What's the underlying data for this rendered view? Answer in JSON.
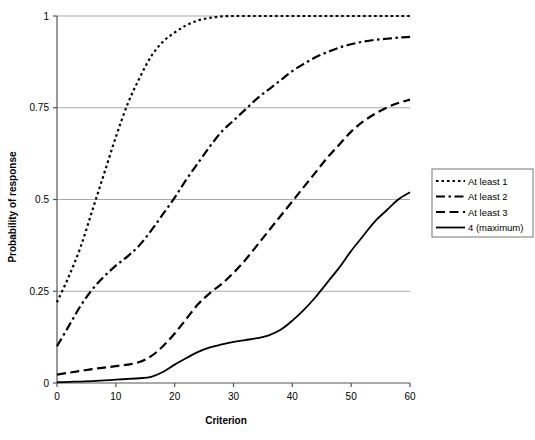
{
  "chart_data": {
    "type": "line",
    "title": "",
    "xlabel": "Criterion",
    "ylabel": "Probability of response",
    "xlim": [
      0,
      60
    ],
    "ylim": [
      0,
      1
    ],
    "xticks": [
      0,
      10,
      20,
      30,
      40,
      50,
      60
    ],
    "yticks": [
      0,
      0.25,
      0.5,
      0.75,
      1
    ],
    "xtick_labels": [
      "0",
      "10",
      "20",
      "30",
      "40",
      "50",
      "60"
    ],
    "ytick_labels": [
      "0",
      "0.25",
      "0.5",
      "0.75",
      "1"
    ],
    "grid": "horizontal",
    "legend_position": "right",
    "x": [
      0,
      2,
      4,
      6,
      8,
      10,
      12,
      14,
      16,
      18,
      20,
      22,
      24,
      26,
      28,
      30,
      32,
      34,
      36,
      38,
      40,
      42,
      44,
      46,
      48,
      50,
      52,
      54,
      56,
      58,
      60
    ],
    "series": [
      {
        "name": "At least 1",
        "style": "dotted",
        "color": "#000000",
        "values": [
          0.22,
          0.29,
          0.37,
          0.47,
          0.57,
          0.67,
          0.76,
          0.83,
          0.89,
          0.93,
          0.955,
          0.975,
          0.988,
          0.995,
          0.999,
          1.0,
          1.0,
          1.0,
          1.0,
          1.0,
          1.0,
          1.0,
          1.0,
          1.0,
          1.0,
          1.0,
          1.0,
          1.0,
          1.0,
          1.0,
          1.0
        ]
      },
      {
        "name": "At least 2",
        "style": "dash-dot",
        "color": "#000000",
        "values": [
          0.1,
          0.155,
          0.21,
          0.255,
          0.29,
          0.32,
          0.345,
          0.375,
          0.415,
          0.46,
          0.505,
          0.555,
          0.6,
          0.645,
          0.685,
          0.715,
          0.745,
          0.775,
          0.8,
          0.825,
          0.85,
          0.87,
          0.888,
          0.902,
          0.914,
          0.923,
          0.93,
          0.935,
          0.938,
          0.941,
          0.943
        ]
      },
      {
        "name": "At least 3",
        "style": "dashed",
        "color": "#000000",
        "values": [
          0.023,
          0.028,
          0.033,
          0.038,
          0.042,
          0.046,
          0.05,
          0.057,
          0.073,
          0.1,
          0.135,
          0.175,
          0.215,
          0.245,
          0.27,
          0.3,
          0.335,
          0.375,
          0.415,
          0.455,
          0.495,
          0.535,
          0.575,
          0.615,
          0.65,
          0.685,
          0.712,
          0.733,
          0.75,
          0.763,
          0.772
        ]
      },
      {
        "name": "4 (maximum)",
        "style": "solid",
        "color": "#000000",
        "values": [
          0.002,
          0.003,
          0.004,
          0.005,
          0.007,
          0.009,
          0.011,
          0.013,
          0.017,
          0.03,
          0.05,
          0.068,
          0.085,
          0.097,
          0.105,
          0.112,
          0.117,
          0.122,
          0.13,
          0.145,
          0.17,
          0.2,
          0.235,
          0.275,
          0.315,
          0.36,
          0.4,
          0.44,
          0.47,
          0.5,
          0.52
        ]
      }
    ]
  },
  "legend": {
    "items": [
      {
        "label": "At least 1",
        "style": "dotted"
      },
      {
        "label": "At least 2",
        "style": "dash-dot"
      },
      {
        "label": "At least 3",
        "style": "dashed"
      },
      {
        "label": "4 (maximum)",
        "style": "solid"
      }
    ]
  },
  "colors": {
    "axis": "#555555",
    "grid": "#aaaaaa",
    "line": "#000000",
    "background": "#ffffff",
    "legend_border": "#777777"
  }
}
